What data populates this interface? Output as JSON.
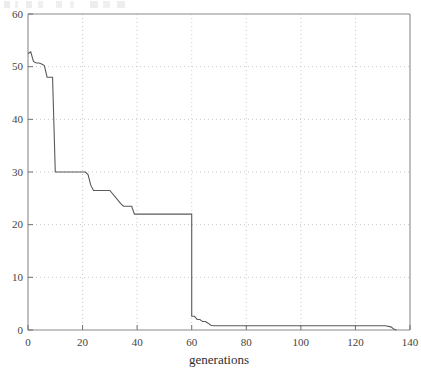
{
  "figure": {
    "background_color": "#ffffff",
    "frame_color": "#8a8a8a",
    "grid_color": "#bdbdbd",
    "line_color": "#5a5a5a"
  },
  "chart_data": {
    "type": "line",
    "title": "",
    "xlabel": "generations",
    "ylabel": "",
    "xlim": [
      0,
      140
    ],
    "ylim": [
      0,
      60
    ],
    "xticks": [
      0,
      20,
      40,
      60,
      80,
      100,
      120,
      140
    ],
    "yticks": [
      0,
      10,
      20,
      30,
      40,
      50,
      60
    ],
    "xtick_labels": [
      "0",
      "20",
      "40",
      "60",
      "80",
      "100",
      "120",
      "140"
    ],
    "ytick_labels": [
      "0",
      "10",
      "20",
      "30",
      "40",
      "50",
      "60"
    ],
    "grid": true,
    "grid_style": "dotted",
    "legend": false,
    "legend_position": "none",
    "series": [
      {
        "name": "best fitness",
        "style": "step",
        "x": [
          0,
          1,
          2,
          3,
          4,
          5,
          6,
          7,
          8,
          9,
          10,
          11,
          21,
          22,
          23,
          24,
          25,
          26,
          30,
          34,
          35,
          38,
          39,
          40,
          43,
          44,
          48,
          55,
          56,
          59,
          60,
          60,
          61,
          62,
          63,
          64,
          65,
          66,
          67,
          68,
          69,
          100,
          120,
          131,
          133,
          134,
          135
        ],
        "y": [
          52.5,
          52.8,
          51.0,
          50.7,
          50.7,
          50.5,
          50.2,
          48.0,
          48.0,
          48.0,
          30.0,
          30.0,
          30.0,
          29.5,
          27.5,
          26.5,
          26.5,
          26.5,
          26.5,
          24.0,
          23.5,
          23.5,
          22.0,
          22.0,
          22.0,
          22.0,
          22.0,
          22.0,
          22.0,
          22.0,
          22.0,
          2.6,
          2.6,
          2.0,
          2.0,
          1.6,
          1.6,
          1.3,
          0.9,
          0.8,
          0.8,
          0.8,
          0.8,
          0.8,
          0.6,
          0.2,
          0.0
        ]
      }
    ],
    "annotations": []
  }
}
